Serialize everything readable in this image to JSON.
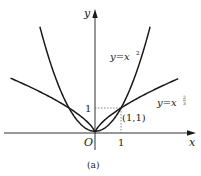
{
  "figure": {
    "caption": "(a)",
    "colors": {
      "curve": "#1a1a1a",
      "axis": "#1a1a1a",
      "guide": "#555555",
      "background": "#ffffff"
    }
  },
  "axes": {
    "x_label": "x",
    "y_label": "y",
    "origin_label": "O",
    "x_tick_label": "1",
    "y_tick_label": "1"
  },
  "curves": {
    "parabola": {
      "label_prefix": "y=x",
      "exponent": "2"
    },
    "power": {
      "label_prefix": "y=x",
      "exponent_num": "2",
      "exponent_den": "3"
    }
  },
  "point": {
    "label": "(1,1)",
    "x": 1,
    "y": 1
  },
  "chart_data": {
    "type": "line",
    "title": "",
    "caption": "(a)",
    "xlabel": "x",
    "ylabel": "y",
    "xlim": [
      -3.6,
      3.8
    ],
    "ylim": [
      -0.5,
      4.9
    ],
    "grid": false,
    "series": [
      {
        "name": "y=x^2",
        "function": "x^2",
        "domain": [
          -2.12,
          2.12
        ]
      },
      {
        "name": "y=x^(2/3)",
        "function": "x^(2/3)",
        "domain": [
          -3.25,
          3.2
        ]
      }
    ],
    "annotations": [
      {
        "text": "(1,1)",
        "x": 1,
        "y": 1
      },
      {
        "text": "1",
        "axis": "x",
        "value": 1
      },
      {
        "text": "1",
        "axis": "y",
        "value": 1
      },
      {
        "text": "O",
        "x": 0,
        "y": 0
      }
    ]
  }
}
